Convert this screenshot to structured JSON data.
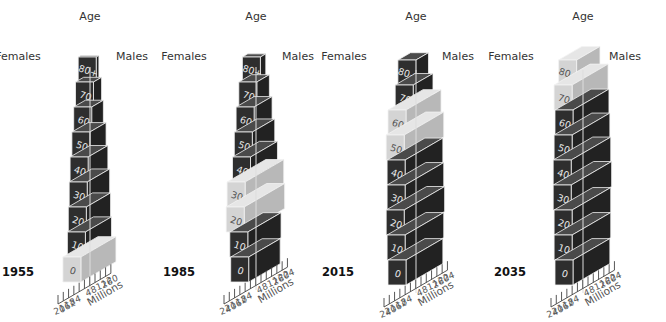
{
  "chart_data": [
    {
      "type": "bar",
      "subtype": "3d-population-pyramid",
      "title": "1955",
      "xlabel": "Millions",
      "ylabel": "Age",
      "left_label": "Females",
      "right_label": "Males",
      "categories": [
        "0",
        "10",
        "20",
        "30",
        "40",
        "50",
        "60",
        "70",
        "80+"
      ],
      "series": [
        {
          "name": "Females",
          "values": [
            19,
            14,
            13,
            12,
            11,
            9,
            7,
            5,
            2
          ]
        },
        {
          "name": "Males",
          "values": [
            20,
            15,
            14,
            13,
            11,
            9,
            6,
            4,
            1
          ]
        }
      ],
      "highlighted": [
        "0"
      ],
      "x_ticks_left": [
        "20",
        "16",
        "12",
        "8",
        "4"
      ],
      "x_ticks_right": [
        "4",
        "8",
        "12",
        "16",
        "20"
      ],
      "xlim": [
        -20,
        20
      ]
    },
    {
      "type": "bar",
      "subtype": "3d-population-pyramid",
      "title": "1985",
      "xlabel": "Millions",
      "ylabel": "Age",
      "left_label": "Females",
      "right_label": "Males",
      "categories": [
        "0",
        "10",
        "20",
        "30",
        "40",
        "50",
        "60",
        "70",
        "80+"
      ],
      "series": [
        {
          "name": "Females",
          "values": [
            17,
            18,
            22,
            21,
            15,
            13,
            11,
            8,
            4
          ]
        },
        {
          "name": "Males",
          "values": [
            18,
            19,
            23,
            22,
            15,
            12,
            9,
            6,
            2
          ]
        }
      ],
      "highlighted": [
        "20",
        "30"
      ],
      "x_ticks_left": [
        "24",
        "20",
        "16",
        "12",
        "8",
        "4"
      ],
      "x_ticks_right": [
        "4",
        "8",
        "12",
        "16",
        "20",
        "24"
      ],
      "xlim": [
        -24,
        24
      ]
    },
    {
      "type": "bar",
      "subtype": "3d-population-pyramid",
      "title": "2015",
      "xlabel": "Millions",
      "ylabel": "Age",
      "left_label": "Females",
      "right_label": "Males",
      "categories": [
        "0",
        "10",
        "20",
        "30",
        "40",
        "50",
        "60",
        "70",
        "80+"
      ],
      "series": [
        {
          "name": "Females",
          "values": [
            20,
            21,
            22,
            21,
            21,
            22,
            20,
            12,
            9
          ]
        },
        {
          "name": "Males",
          "values": [
            21,
            22,
            23,
            22,
            21,
            22,
            19,
            10,
            5
          ]
        }
      ],
      "highlighted": [
        "50",
        "60"
      ],
      "x_ticks_left": [
        "24",
        "20",
        "16",
        "12",
        "8",
        "4"
      ],
      "x_ticks_right": [
        "4",
        "8",
        "12",
        "16",
        "20",
        "24"
      ],
      "xlim": [
        -24,
        24
      ]
    },
    {
      "type": "bar",
      "subtype": "3d-population-pyramid",
      "title": "2035",
      "xlabel": "Millions",
      "ylabel": "Age",
      "left_label": "Females",
      "right_label": "Males",
      "categories": [
        "0",
        "10",
        "20",
        "30",
        "40",
        "50",
        "60",
        "70",
        "80+"
      ],
      "series": [
        {
          "name": "Females",
          "values": [
            20,
            21,
            21,
            22,
            22,
            21,
            20,
            21,
            16
          ]
        },
        {
          "name": "Males",
          "values": [
            21,
            22,
            22,
            23,
            22,
            21,
            20,
            19,
            10
          ]
        }
      ],
      "highlighted": [
        "70",
        "80+"
      ],
      "x_ticks_left": [
        "24",
        "20",
        "16",
        "12",
        "8",
        "4"
      ],
      "x_ticks_right": [
        "4",
        "8",
        "12",
        "16",
        "20",
        "24"
      ],
      "xlim": [
        -24,
        24
      ]
    }
  ],
  "colors": {
    "block_front": "#2e2e2e",
    "block_side": "#222222",
    "block_top": "#4a4a4a",
    "highlight_front": "#d4d4d4",
    "highlight_side": "#b8b8b8",
    "highlight_top": "#e6e6e6",
    "edge": "#f2f2f2",
    "axis": "#444444",
    "text": "#333333",
    "year_text": "#111111"
  }
}
